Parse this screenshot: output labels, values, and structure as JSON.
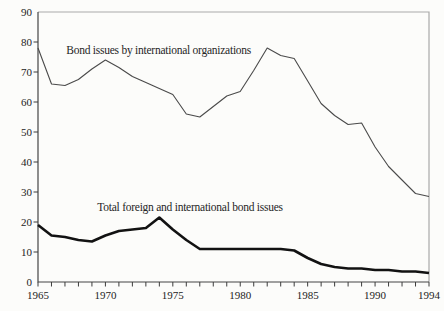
{
  "figure": {
    "background": "#fcfcfa",
    "width": 444,
    "height": 311
  },
  "chart_data": {
    "type": "line",
    "title": "",
    "xlabel": "",
    "ylabel": "",
    "grid": false,
    "legend_position": "none",
    "xlim": [
      1965,
      1994
    ],
    "ylim": [
      0,
      90
    ],
    "x": [
      1965,
      1966,
      1967,
      1968,
      1969,
      1970,
      1971,
      1972,
      1973,
      1974,
      1975,
      1976,
      1977,
      1978,
      1979,
      1980,
      1981,
      1982,
      1983,
      1984,
      1985,
      1986,
      1987,
      1988,
      1989,
      1990,
      1991,
      1992,
      1993,
      1994
    ],
    "series": [
      {
        "name": "Bond issues by international organizations",
        "style": "thin",
        "values": [
          78,
          66,
          65.5,
          67.5,
          71,
          74,
          71.5,
          68.5,
          66.5,
          64.5,
          62.5,
          56,
          55,
          58.5,
          62,
          63.5,
          70.5,
          78,
          75.5,
          74.5,
          67,
          59.5,
          55.5,
          52.5,
          53,
          45,
          38.5,
          34,
          29.5,
          28.5
        ]
      },
      {
        "name": "Total foreign and international bond issues",
        "style": "thick",
        "values": [
          19,
          15.5,
          15,
          14,
          13.5,
          15.5,
          17,
          17.5,
          18,
          21.5,
          17.5,
          14,
          11,
          11,
          11,
          11,
          11,
          11,
          11,
          10.5,
          8,
          6,
          5,
          4.5,
          4.5,
          4,
          4,
          3.5,
          3.5,
          3
        ]
      }
    ],
    "yticks": [
      0,
      10,
      20,
      30,
      40,
      50,
      60,
      70,
      80,
      90
    ],
    "ytick_labels": [
      "0",
      "10",
      "20",
      "30",
      "40",
      "50",
      "60",
      "70",
      "80",
      "90"
    ],
    "xtick_minor_years": [
      1965,
      1966,
      1967,
      1968,
      1969,
      1970,
      1971,
      1972,
      1973,
      1974,
      1975,
      1976,
      1977,
      1978,
      1979,
      1980,
      1981,
      1982,
      1983,
      1984,
      1985,
      1986,
      1987,
      1988,
      1989,
      1990,
      1991,
      1992,
      1993,
      1994
    ],
    "xtick_label_years": [
      1965,
      1970,
      1975,
      1980,
      1985,
      1990,
      1994
    ],
    "xtick_labels": [
      "1965",
      "1970",
      "1975",
      "1980",
      "1985",
      "1990",
      "1994"
    ],
    "annotations": [
      {
        "text": "Bond issues by international organizations",
        "year": 1967.1,
        "value": 76
      },
      {
        "text": "Total foreign and international bond issues",
        "year": 1969.4,
        "value": 23.8
      }
    ],
    "colors": {
      "thin_line": "#4a4a4a",
      "thick_line": "#121212",
      "axis_dark": "#454545",
      "frame_light": "#a9a9a9",
      "text": "#232323",
      "background": "#fcfcfa"
    }
  }
}
